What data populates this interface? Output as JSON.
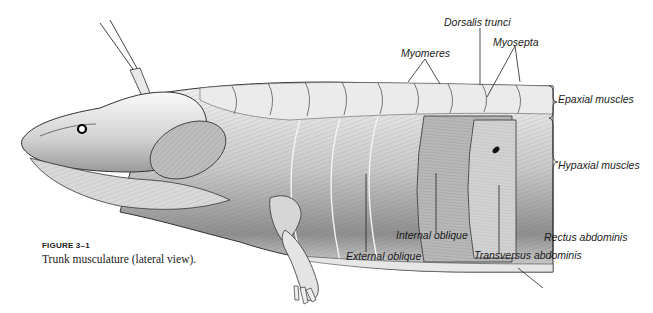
{
  "figure": {
    "number": "FIGURE 3–1",
    "caption": "Trunk musculature (lateral view).",
    "labels": {
      "myomeres": "Myomeres",
      "dorsalis_trunci": "Dorsalis trunci",
      "myosepta": "Myosepta",
      "epaxial_muscles": "Epaxial muscles",
      "hypaxial_muscles": "Hypaxial muscles",
      "rectus_abdominis": "Rectus abdominis",
      "transversus_abdominis": "Transversus abdominis",
      "internal_oblique": "Internal oblique",
      "external_oblique": "External oblique"
    }
  }
}
